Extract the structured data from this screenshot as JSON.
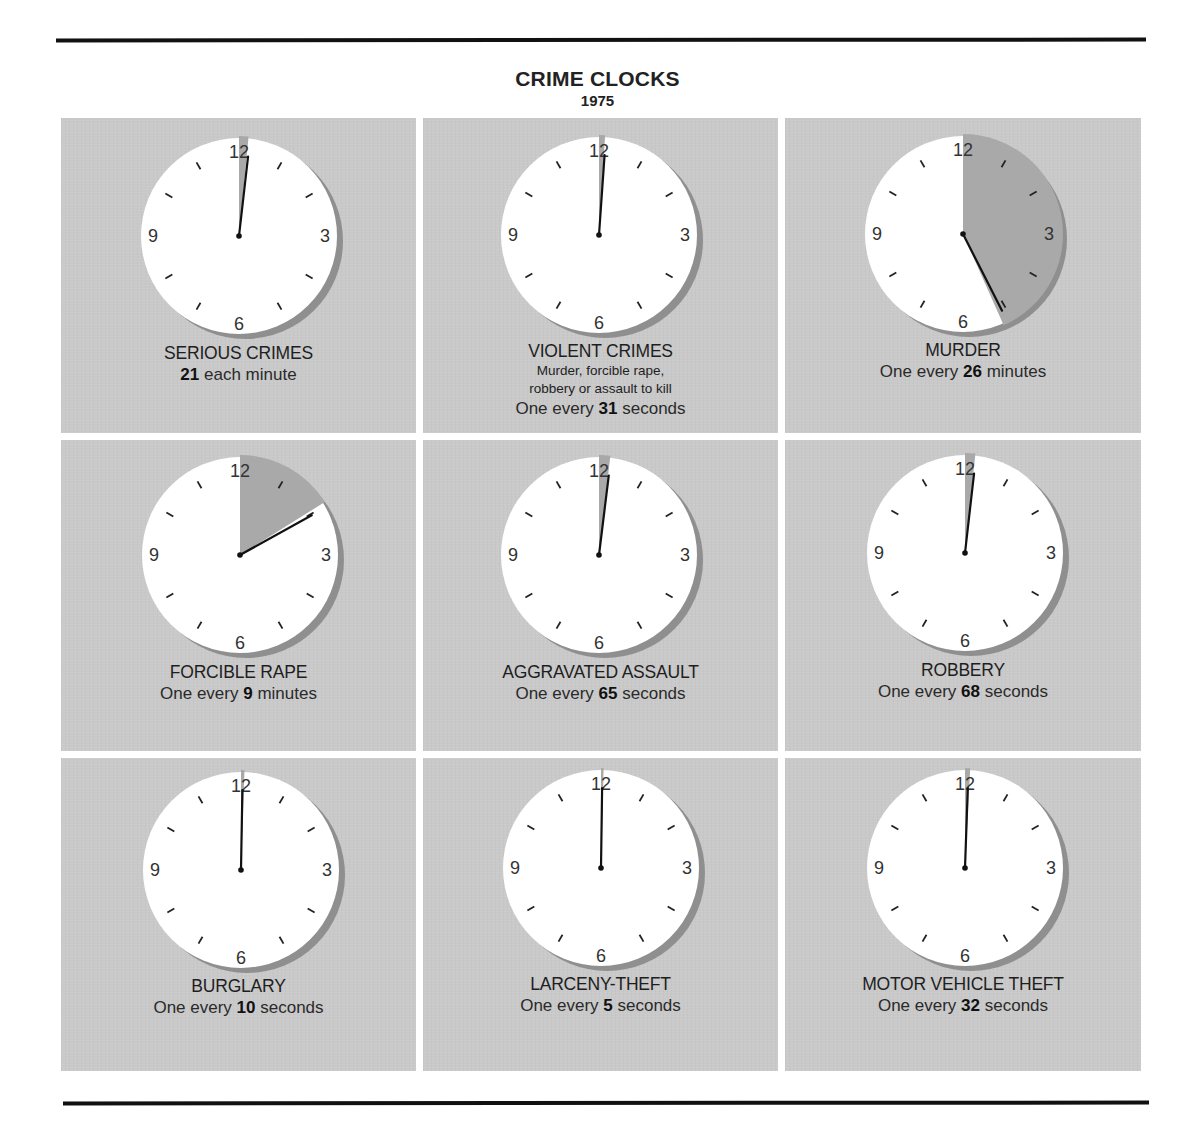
{
  "page": {
    "title": "CRIME CLOCKS",
    "year": "1975"
  },
  "colors": {
    "page_background": "#ffffff",
    "panel_background": "#c9c9c9",
    "clock_face": "#ffffff",
    "elapsed_wedge": "#a9a9a9",
    "clock_shadow": "#8f8f8f",
    "hand": "#111111",
    "text": "#222222"
  },
  "clock_numerals": [
    "12",
    "3",
    "6",
    "9"
  ],
  "panels": [
    {
      "name": "SERIOUS CRIMES",
      "description": "",
      "rate_prefix": "",
      "rate_value": "21",
      "rate_suffix": " each minute"
    },
    {
      "name": "VIOLENT CRIMES",
      "description_line1": "Murder, forcible rape,",
      "description_line2": "robbery or assault to kill",
      "rate_prefix": "One every ",
      "rate_value": "31",
      "rate_suffix": " seconds"
    },
    {
      "name": "MURDER",
      "description": "",
      "rate_prefix": "One every ",
      "rate_value": "26",
      "rate_suffix": " minutes"
    },
    {
      "name": "FORCIBLE RAPE",
      "description": "",
      "rate_prefix": "One every ",
      "rate_value": "9",
      "rate_suffix": " minutes"
    },
    {
      "name": "AGGRAVATED ASSAULT",
      "description": "",
      "rate_prefix": "One every ",
      "rate_value": "65",
      "rate_suffix": " seconds"
    },
    {
      "name": "ROBBERY",
      "description": "",
      "rate_prefix": "One every ",
      "rate_value": "68",
      "rate_suffix": " seconds"
    },
    {
      "name": "BURGLARY",
      "description": "",
      "rate_prefix": "One every ",
      "rate_value": "10",
      "rate_suffix": " seconds"
    },
    {
      "name": "LARCENY-THEFT",
      "description": "",
      "rate_prefix": "One every ",
      "rate_value": "5",
      "rate_suffix": " seconds"
    },
    {
      "name": "MOTOR VEHICLE THEFT",
      "description": "",
      "rate_prefix": "One every ",
      "rate_value": "32",
      "rate_suffix": " seconds"
    }
  ],
  "chart_data": {
    "type": "pie",
    "title": "CRIME CLOCKS",
    "subtitle": "1975",
    "layout": "3x3 grid of clock-face pie charts; gray wedge swept clockwise from 12 to the hand shows the interval between offenses on a 60-unit dial",
    "grid": false,
    "legend": null,
    "categories": [
      "SERIOUS CRIMES",
      "VIOLENT CRIMES",
      "MURDER",
      "FORCIBLE RAPE",
      "AGGRAVATED ASSAULT",
      "ROBBERY",
      "BURGLARY",
      "LARCENY-THEFT",
      "MOTOR VEHICLE THEFT"
    ],
    "rates": [
      {
        "category": "SERIOUS CRIMES",
        "value": 21,
        "unit": "each minute"
      },
      {
        "category": "VIOLENT CRIMES",
        "value": 31,
        "unit": "seconds",
        "note": "Murder, forcible rape, robbery or assault to kill"
      },
      {
        "category": "MURDER",
        "value": 26,
        "unit": "minutes"
      },
      {
        "category": "FORCIBLE RAPE",
        "value": 9,
        "unit": "minutes"
      },
      {
        "category": "AGGRAVATED ASSAULT",
        "value": 65,
        "unit": "seconds"
      },
      {
        "category": "ROBBERY",
        "value": 68,
        "unit": "seconds"
      },
      {
        "category": "BURGLARY",
        "value": 10,
        "unit": "seconds"
      },
      {
        "category": "LARCENY-THEFT",
        "value": 5,
        "unit": "seconds"
      },
      {
        "category": "MOTOR VEHICLE THEFT",
        "value": 32,
        "unit": "seconds"
      }
    ],
    "wedge_degrees": [
      5.5,
      3.5,
      156,
      58,
      6.5,
      6,
      2,
      1.5,
      3
    ],
    "hand_degrees": [
      6.5,
      4,
      153,
      61,
      7,
      6.5,
      1,
      0.8,
      2
    ],
    "dial_labels": [
      "12",
      "3",
      "6",
      "9"
    ]
  }
}
